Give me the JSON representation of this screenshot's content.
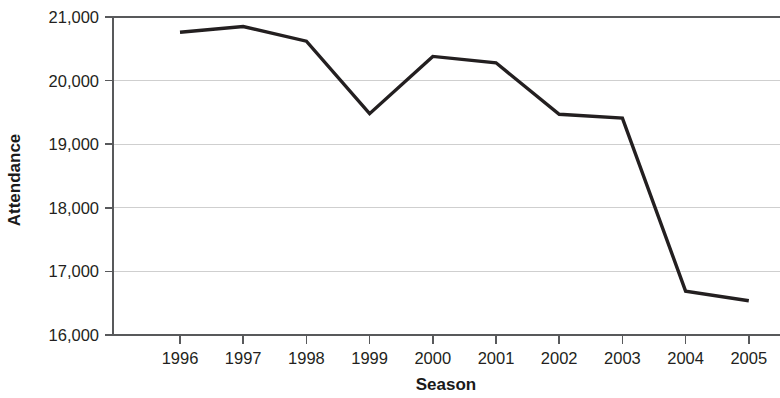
{
  "chart_data": {
    "type": "line",
    "title": "",
    "xlabel": "Season",
    "ylabel": "Attendance",
    "categories": [
      "1996",
      "1997",
      "1998",
      "1999",
      "2000",
      "2001",
      "2002",
      "2003",
      "2004",
      "2005"
    ],
    "x": [
      1996,
      1997,
      1998,
      1999,
      2000,
      2001,
      2002,
      2003,
      2004,
      2005
    ],
    "values": [
      20760,
      20850,
      20620,
      19480,
      20380,
      20280,
      19470,
      19410,
      16690,
      16540
    ],
    "series": [
      {
        "name": "Attendance",
        "values": [
          20760,
          20850,
          20620,
          19480,
          20380,
          20280,
          19470,
          19410,
          16690,
          16540
        ]
      }
    ],
    "ylim": [
      16000,
      21000
    ],
    "yticks": [
      16000,
      17000,
      18000,
      19000,
      20000,
      21000
    ],
    "ytick_labels": [
      "16,000",
      "17,000",
      "18,000",
      "19,000",
      "20,000",
      "21,000"
    ],
    "xtick_labels": [
      "1996",
      "1997",
      "1998",
      "1999",
      "2000",
      "2001",
      "2002",
      "2003",
      "2004",
      "2005"
    ],
    "grid": true,
    "grid_axis": "y",
    "legend": false,
    "legend_position": "none",
    "line_color": "#231f20",
    "grid_color": "#cfcfcf",
    "axis_color": "#58595b"
  }
}
